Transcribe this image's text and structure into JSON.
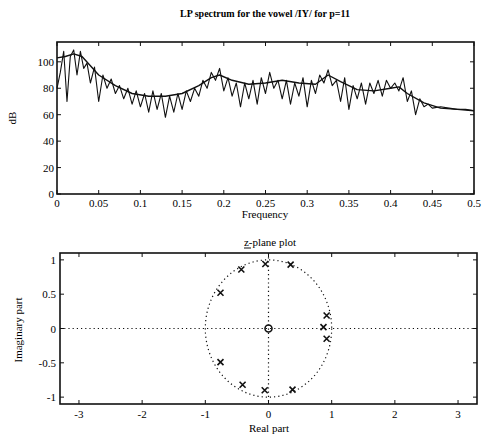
{
  "chart_data": [
    {
      "type": "line",
      "title": "LP spectrum for the vowel /IY/ for p=11",
      "xlabel": "Frequency",
      "ylabel": "dB",
      "xlim": [
        0,
        0.5
      ],
      "ylim": [
        0,
        115
      ],
      "xticks": [
        "0",
        "0.05",
        "0.1",
        "0.15",
        "0.2",
        "0.25",
        "0.3",
        "0.35",
        "0.4",
        "0.45",
        "0.5"
      ],
      "yticks": [
        "0",
        "20",
        "40",
        "60",
        "80",
        "100"
      ],
      "grid": false,
      "series": [
        {
          "name": "LP envelope (smooth)",
          "x": [
            0,
            0.01,
            0.02,
            0.03,
            0.04,
            0.05,
            0.07,
            0.09,
            0.11,
            0.13,
            0.15,
            0.17,
            0.185,
            0.195,
            0.21,
            0.23,
            0.25,
            0.27,
            0.29,
            0.31,
            0.325,
            0.34,
            0.36,
            0.38,
            0.4,
            0.41,
            0.42,
            0.44,
            0.46,
            0.48,
            0.5
          ],
          "values": [
            103,
            104,
            106,
            104,
            97,
            90,
            82,
            76,
            74,
            74,
            76,
            82,
            88,
            90,
            86,
            83,
            84,
            86,
            84,
            83,
            90,
            85,
            79,
            78,
            80,
            81,
            76,
            69,
            65,
            64,
            63
          ]
        },
        {
          "name": "FFT spectrum (harmonic)",
          "x": [
            0,
            0.004,
            0.008,
            0.012,
            0.016,
            0.02,
            0.024,
            0.028,
            0.032,
            0.036,
            0.04,
            0.045,
            0.05,
            0.055,
            0.06,
            0.065,
            0.07,
            0.075,
            0.08,
            0.085,
            0.09,
            0.095,
            0.1,
            0.105,
            0.11,
            0.115,
            0.12,
            0.125,
            0.13,
            0.135,
            0.14,
            0.145,
            0.15,
            0.155,
            0.16,
            0.165,
            0.17,
            0.175,
            0.18,
            0.185,
            0.19,
            0.195,
            0.2,
            0.205,
            0.21,
            0.215,
            0.22,
            0.225,
            0.23,
            0.235,
            0.24,
            0.245,
            0.25,
            0.255,
            0.26,
            0.265,
            0.27,
            0.275,
            0.28,
            0.285,
            0.29,
            0.295,
            0.3,
            0.305,
            0.31,
            0.315,
            0.32,
            0.325,
            0.33,
            0.335,
            0.34,
            0.345,
            0.35,
            0.355,
            0.36,
            0.365,
            0.37,
            0.375,
            0.38,
            0.385,
            0.39,
            0.395,
            0.4,
            0.405,
            0.41,
            0.415,
            0.42,
            0.425,
            0.43,
            0.435,
            0.44,
            0.445,
            0.45,
            0.46,
            0.47,
            0.48,
            0.49,
            0.5
          ],
          "values": [
            80,
            92,
            108,
            70,
            104,
            109,
            90,
            108,
            95,
            99,
            84,
            96,
            70,
            90,
            80,
            87,
            76,
            82,
            72,
            80,
            68,
            78,
            66,
            76,
            62,
            78,
            64,
            76,
            58,
            74,
            62,
            76,
            64,
            78,
            70,
            80,
            74,
            86,
            80,
            92,
            86,
            95,
            78,
            88,
            74,
            84,
            66,
            84,
            72,
            86,
            68,
            88,
            76,
            92,
            80,
            86,
            72,
            86,
            68,
            84,
            74,
            88,
            66,
            86,
            76,
            90,
            84,
            94,
            82,
            86,
            70,
            88,
            64,
            82,
            72,
            84,
            68,
            84,
            76,
            86,
            74,
            86,
            80,
            84,
            78,
            88,
            70,
            78,
            60,
            72,
            66,
            68,
            65,
            66,
            65,
            64,
            64,
            63
          ]
        }
      ]
    },
    {
      "type": "scatter",
      "title": "z-plane plot",
      "xlabel": "Real part",
      "ylabel": "Imaginary part",
      "xlim": [
        -3.3,
        3.3
      ],
      "ylim": [
        -1.1,
        1.1
      ],
      "xticks": [
        "-3",
        "-2",
        "-1",
        "0",
        "1",
        "2",
        "3"
      ],
      "yticks": [
        "-1",
        "-0.5",
        "0",
        "0.5",
        "1"
      ],
      "unit_circle": true,
      "reference_lines": [
        "real axis (dotted)",
        "imaginary axis (dotted)"
      ],
      "series": [
        {
          "name": "poles",
          "marker": "x",
          "points": [
            [
              -0.05,
              0.94
            ],
            [
              -0.43,
              0.86
            ],
            [
              -0.76,
              0.52
            ],
            [
              0.35,
              0.93
            ],
            [
              0.92,
              0.19
            ],
            [
              0.87,
              0.02
            ],
            [
              0.92,
              -0.15
            ],
            [
              -0.76,
              -0.49
            ],
            [
              -0.41,
              -0.82
            ],
            [
              -0.06,
              -0.9
            ],
            [
              0.38,
              -0.89
            ]
          ]
        },
        {
          "name": "zeros",
          "marker": "o",
          "points": [
            [
              0,
              0
            ]
          ]
        }
      ]
    }
  ]
}
